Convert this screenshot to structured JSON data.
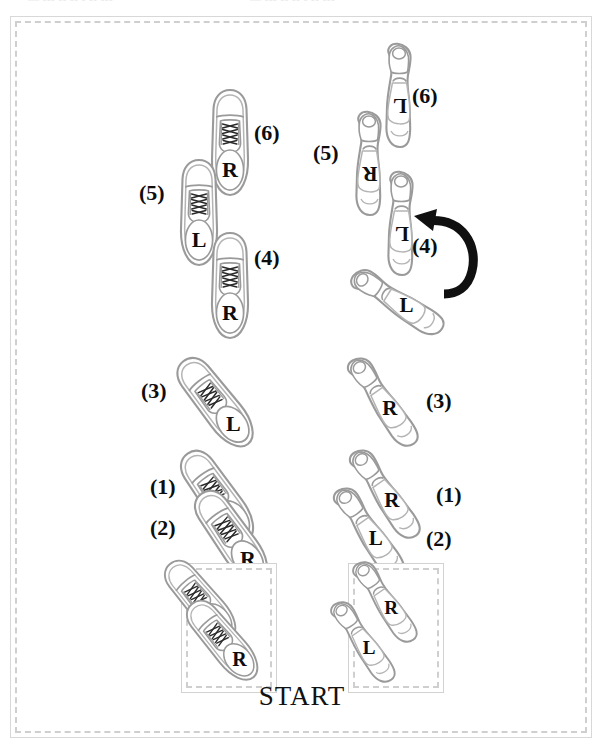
{
  "figure": {
    "type": "dance-step-footprint-diagram",
    "start_label": "START",
    "scan_artifact_text": "— ---  --   -- -    -- ---",
    "frame_border_color": "#cfcfcf",
    "shoe_outline_color": "#9a9a9a",
    "arrow_color": "#101010",
    "label_color": "#141414"
  },
  "columns": [
    {
      "id": "left",
      "name": "leaders-column",
      "shoe_style": "mens-dress-shoe"
    },
    {
      "id": "right",
      "name": "followers-column",
      "shoe_style": "womens-heel-shoe"
    }
  ],
  "left_column": {
    "start_box": {
      "name": "left-start-box",
      "shoes": [
        {
          "foot": "L",
          "step": "",
          "rotation": -35
        },
        {
          "foot": "R",
          "step": "",
          "rotation": -35
        }
      ]
    },
    "steps": [
      {
        "step": "(1)",
        "foot": "L",
        "rotation": -35
      },
      {
        "step": "(2)",
        "foot": "R",
        "rotation": -35
      },
      {
        "step": "(3)",
        "foot": "L",
        "rotation": -38
      },
      {
        "step": "(4)",
        "foot": "R",
        "rotation": 0
      },
      {
        "step": "(5)",
        "foot": "L",
        "rotation": 0
      },
      {
        "step": "(6)",
        "foot": "R",
        "rotation": 0
      }
    ]
  },
  "right_column": {
    "start_box": {
      "name": "right-start-box",
      "shoes": [
        {
          "foot": "R",
          "step": "",
          "rotation": 145
        },
        {
          "foot": "L",
          "step": "",
          "rotation": 145
        }
      ]
    },
    "steps": [
      {
        "step": "(1)",
        "foot": "R",
        "rotation": 145
      },
      {
        "step": "(2)",
        "foot": "L",
        "rotation": 145
      },
      {
        "step": "(3)",
        "foot": "R",
        "rotation": 145
      },
      {
        "step": "(4)",
        "foot": "L",
        "rotation": 122
      },
      {
        "step": "(4)",
        "foot": "L",
        "rotation": 180,
        "note": "after-turn"
      },
      {
        "step": "(5)",
        "foot": "R",
        "rotation": 180
      },
      {
        "step": "(6)",
        "foot": "L",
        "rotation": 180
      }
    ],
    "rotation_arrow": {
      "name": "turn-arrow",
      "direction": "counter-clockwise",
      "at_step": "(4)"
    }
  },
  "step_numbers": {
    "l1": "(1)",
    "l2": "(2)",
    "l3": "(3)",
    "l4": "(4)",
    "l5": "(5)",
    "l6": "(6)",
    "r1": "(1)",
    "r2": "(2)",
    "r3": "(3)",
    "r4": "(4)",
    "r5": "(5)",
    "r6": "(6)"
  },
  "foot_labels": {
    "L": "L",
    "R": "R"
  }
}
